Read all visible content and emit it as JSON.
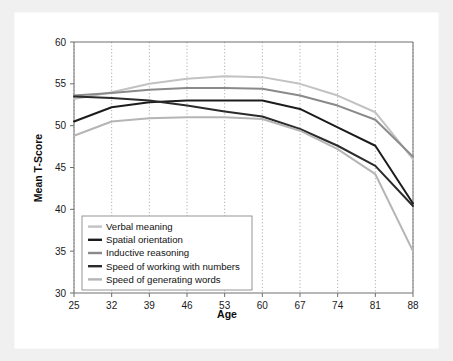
{
  "chart_data": {
    "type": "line",
    "title": "",
    "xlabel": "Age",
    "ylabel": "Mean T-Score",
    "x": [
      25,
      32,
      39,
      46,
      53,
      60,
      67,
      74,
      81,
      88
    ],
    "xticklabels": [
      "25",
      "32",
      "39",
      "46",
      "53",
      "60",
      "67",
      "74",
      "81",
      "88"
    ],
    "yticklabels": [
      "30",
      "35",
      "40",
      "45",
      "50",
      "55",
      "60"
    ],
    "xlim": [
      25,
      88
    ],
    "ylim": [
      30,
      60
    ],
    "ytick_step": 5,
    "grid": "vertical-dotted",
    "legend_position": "bottom-left-inside",
    "series": [
      {
        "name": "Verbal meaning",
        "color": "#c2c2c2",
        "width": 2.0,
        "values": [
          53.2,
          54.0,
          55.0,
          55.6,
          55.9,
          55.8,
          55.0,
          53.6,
          51.6,
          46.0
        ]
      },
      {
        "name": "Spatial orientation",
        "color": "#1c1c1c",
        "width": 2.0,
        "values": [
          50.5,
          52.2,
          52.8,
          53.0,
          53.0,
          53.0,
          52.0,
          49.8,
          47.6,
          40.7
        ]
      },
      {
        "name": "Inductive reasoning",
        "color": "#8a8a8a",
        "width": 2.0,
        "values": [
          53.6,
          53.9,
          54.3,
          54.5,
          54.5,
          54.4,
          53.6,
          52.4,
          50.7,
          46.3
        ]
      },
      {
        "name": "Speed of working with numbers",
        "color": "#2b2b2b",
        "width": 2.0,
        "values": [
          53.5,
          53.3,
          53.0,
          52.4,
          51.7,
          51.1,
          49.6,
          47.6,
          45.2,
          40.4
        ]
      },
      {
        "name": "Speed of generating words",
        "color": "#b5b5b5",
        "width": 2.0,
        "values": [
          48.8,
          50.5,
          50.9,
          51.0,
          51.0,
          50.8,
          49.4,
          47.2,
          44.2,
          35.0
        ]
      }
    ]
  },
  "legend": {
    "items": [
      {
        "label": "Verbal meaning"
      },
      {
        "label": "Spatial orientation"
      },
      {
        "label": "Inductive reasoning"
      },
      {
        "label": "Speed of working with numbers"
      },
      {
        "label": "Speed of generating words"
      }
    ]
  }
}
